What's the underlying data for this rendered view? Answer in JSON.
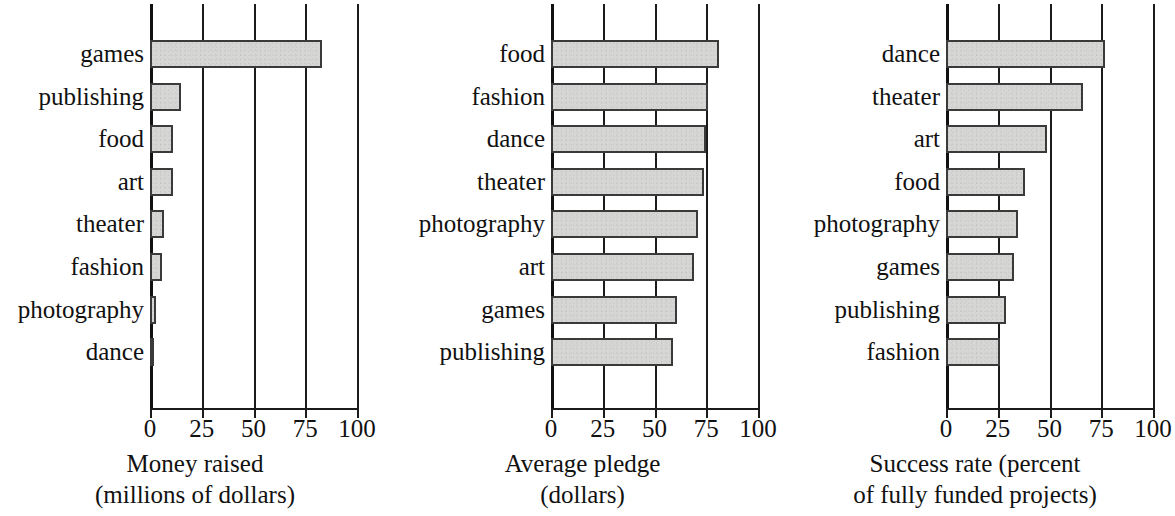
{
  "figure": {
    "kind": "three-panel-horizontal-bar-chart",
    "background": "#ffffff",
    "bar_fill": "#d6d6d4",
    "bar_stroke": "#3a3a3a",
    "axis_color": "#1b1b1b"
  },
  "chart_data": [
    {
      "type": "bar",
      "orientation": "horizontal",
      "title": "",
      "xlabel": "Money raised (millions of dollars)",
      "xlabel_lines": [
        "Money raised",
        "(millions of dollars)"
      ],
      "ylabel": "",
      "categories": [
        "games",
        "publishing",
        "food",
        "art",
        "theater",
        "fashion",
        "photography",
        "dance"
      ],
      "values": [
        83,
        15,
        11,
        11,
        7,
        6,
        3,
        1.5
      ],
      "xlim": [
        0,
        100
      ],
      "xticks": [
        0,
        25,
        50,
        75,
        100
      ],
      "xtick_labels": [
        "0",
        "25",
        "50",
        "75",
        "100"
      ],
      "grid": "vertical gridlines at each x tick",
      "legend": "none"
    },
    {
      "type": "bar",
      "orientation": "horizontal",
      "title": "",
      "xlabel": "Average pledge (dollars)",
      "xlabel_lines": [
        "Average pledge",
        "(dollars)"
      ],
      "ylabel": "",
      "categories": [
        "food",
        "fashion",
        "dance",
        "theater",
        "photography",
        "art",
        "games",
        "publishing"
      ],
      "values": [
        81,
        76,
        75,
        74,
        71,
        69,
        61,
        59
      ],
      "xlim": [
        0,
        100
      ],
      "xticks": [
        0,
        25,
        50,
        75,
        100
      ],
      "xtick_labels": [
        "0",
        "25",
        "50",
        "75",
        "100"
      ],
      "grid": "vertical gridlines at each x tick",
      "legend": "none"
    },
    {
      "type": "bar",
      "orientation": "horizontal",
      "title": "",
      "xlabel": "Success rate (percent of fully funded projects)",
      "xlabel_lines": [
        "Success rate (percent",
        "of fully funded projects)"
      ],
      "ylabel": "",
      "categories": [
        "dance",
        "theater",
        "art",
        "food",
        "photography",
        "games",
        "publishing",
        "fashion"
      ],
      "values": [
        77,
        66,
        49,
        38,
        35,
        33,
        29,
        26
      ],
      "xlim": [
        0,
        100
      ],
      "xticks": [
        0,
        25,
        50,
        75,
        100
      ],
      "xtick_labels": [
        "0",
        "25",
        "50",
        "75",
        "100"
      ],
      "grid": "vertical gridlines at each x tick",
      "legend": "none"
    }
  ]
}
